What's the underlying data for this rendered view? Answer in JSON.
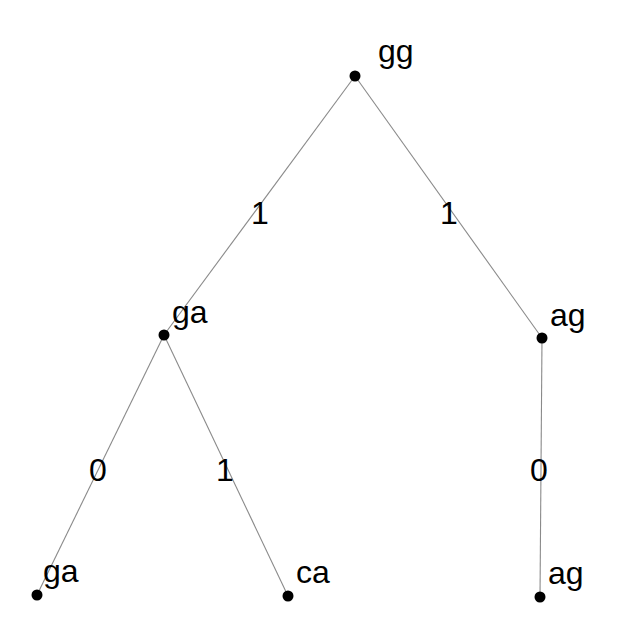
{
  "diagram": {
    "type": "tree",
    "nodes": [
      {
        "id": "n0",
        "label": "gg",
        "x": 355,
        "y": 76,
        "label_x": 378,
        "label_y": 62
      },
      {
        "id": "n1",
        "label": "ga",
        "x": 164,
        "y": 335,
        "label_x": 172,
        "label_y": 323
      },
      {
        "id": "n2",
        "label": "ag",
        "x": 542,
        "y": 338,
        "label_x": 550,
        "label_y": 326
      },
      {
        "id": "n3",
        "label": "ga",
        "x": 37,
        "y": 595,
        "label_x": 43,
        "label_y": 582
      },
      {
        "id": "n4",
        "label": "ca",
        "x": 288,
        "y": 596,
        "label_x": 296,
        "label_y": 583
      },
      {
        "id": "n5",
        "label": "ag",
        "x": 540,
        "y": 597,
        "label_x": 548,
        "label_y": 584
      }
    ],
    "edges": [
      {
        "from": "n0",
        "to": "n1",
        "label": "1",
        "label_x": 251,
        "label_y": 224
      },
      {
        "from": "n0",
        "to": "n2",
        "label": "1",
        "label_x": 440,
        "label_y": 224
      },
      {
        "from": "n1",
        "to": "n3",
        "label": "0",
        "label_x": 89,
        "label_y": 481
      },
      {
        "from": "n1",
        "to": "n4",
        "label": "1",
        "label_x": 216,
        "label_y": 481
      },
      {
        "from": "n2",
        "to": "n5",
        "label": "0",
        "label_x": 530,
        "label_y": 481
      }
    ]
  }
}
